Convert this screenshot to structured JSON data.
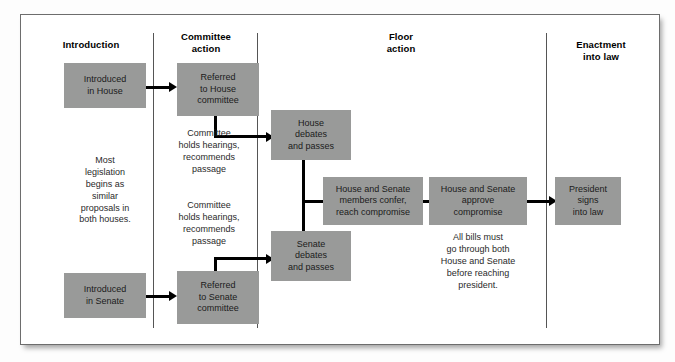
{
  "diagram": {
    "box_color": "#999a99",
    "line_color": "#000000",
    "frame_color": "#6d6d6d"
  },
  "columns": [
    {
      "id": "introduction",
      "label": "Introduction"
    },
    {
      "id": "committee",
      "label": "Committee\naction",
      "line1": "Committee",
      "line2": "action"
    },
    {
      "id": "floor",
      "label": "Floor\naction",
      "line1": "Floor",
      "line2": "action"
    },
    {
      "id": "enactment",
      "label": "Enactment\ninto law",
      "line1": "Enactment",
      "line2": "into law"
    }
  ],
  "boxes": {
    "introduced_house": {
      "l1": "Introduced",
      "l2": "in House"
    },
    "referred_house": {
      "l1": "Referred",
      "l2": "to House",
      "l3": "committee"
    },
    "house_debates": {
      "l1": "House",
      "l2": "debates",
      "l3": "and passes"
    },
    "introduced_senate": {
      "l1": "Introduced",
      "l2": "in Senate"
    },
    "referred_senate": {
      "l1": "Referred",
      "l2": "to Senate",
      "l3": "committee"
    },
    "senate_debates": {
      "l1": "Senate",
      "l2": "debates",
      "l3": "and passes"
    },
    "members_confer": {
      "l1": "House and Senate",
      "l2": "members confer,",
      "l3": "reach compromise"
    },
    "approve": {
      "l1": "House and Senate",
      "l2": "approve",
      "l3": "compromise"
    },
    "president": {
      "l1": "President",
      "l2": "signs",
      "l3": "into law"
    }
  },
  "notes": {
    "most_legislation": {
      "l1": "Most",
      "l2": "legislation",
      "l3": "begins as",
      "l4": "similar",
      "l5": "proposals in",
      "l6": "both houses."
    },
    "committee_hearings_house": {
      "l1": "Committee",
      "l2": "holds hearings,",
      "l3": "recommends",
      "l4": "passage"
    },
    "committee_hearings_senate": {
      "l1": "Committee",
      "l2": "holds hearings,",
      "l3": "recommends",
      "l4": "passage"
    },
    "all_bills": {
      "l1": "All bills must",
      "l2": "go through both",
      "l3": "House and Senate",
      "l4": "before reaching",
      "l5": "president."
    }
  }
}
